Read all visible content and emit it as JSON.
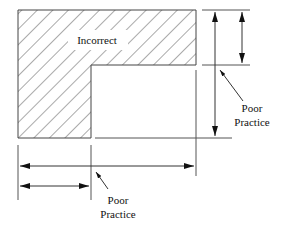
{
  "diagram": {
    "labels": {
      "incorrect": "Incorrect",
      "right_note_line1": "Poor",
      "right_note_line2": "Practice",
      "bottom_note_line1": "Poor",
      "bottom_note_line2": "Practice"
    },
    "colors": {
      "line": "#333333",
      "hatch": "#555555",
      "background": "#ffffff"
    }
  }
}
